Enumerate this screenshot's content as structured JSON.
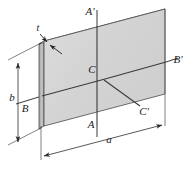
{
  "figure": {
    "type": "engineering-diagram",
    "background_color": "#ffffff",
    "plate": {
      "face_fill": "#d7d7d7",
      "face_fill_light": "#e2e2e2",
      "edge_fill": "#b9b9b9",
      "top_fill": "#ededed",
      "outline_color": "#4a4a4a",
      "outline_width": 0.8
    },
    "axis_line_color": "#3a3a3a",
    "dimension_line_color": "#2e2e2e",
    "labels": {
      "thickness": "t",
      "length": "a",
      "height": "b",
      "axis_a_top": "A'",
      "axis_a_bottom": "A",
      "axis_b_left": "B",
      "axis_b_right": "B'",
      "centroid": "C",
      "centroid_prime": "C'"
    },
    "label_positions": {
      "thickness": {
        "x": 38,
        "y": 32
      },
      "length": {
        "x": 109,
        "y": 144
      },
      "height": {
        "x": 13,
        "y": 97
      },
      "axis_a_top": {
        "x": 90,
        "y": 15
      },
      "axis_a_bottom": {
        "x": 92,
        "y": 128
      },
      "axis_b_left": {
        "x": 25,
        "y": 110
      },
      "axis_b_right": {
        "x": 169,
        "y": 63
      },
      "centroid": {
        "x": 94,
        "y": 70
      },
      "centroid_prime": {
        "x": 142,
        "y": 112
      }
    },
    "dimensions": {
      "a_arrows": "double",
      "b_arrows": "double",
      "t_arrows": "double"
    }
  }
}
